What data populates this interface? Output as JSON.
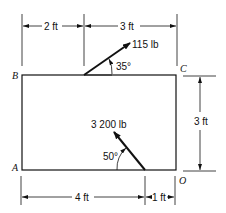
{
  "diagram": {
    "points": {
      "A": "A",
      "B": "B",
      "C": "C",
      "O": "O"
    },
    "dimensions": {
      "top_left": "2 ft",
      "top_right": "3 ft",
      "right_height": "3 ft",
      "bottom_left": "4 ft",
      "bottom_right": "1 ft"
    },
    "forces": [
      {
        "magnitude": "115 lb",
        "angle": "35°",
        "location": "top edge, 2 ft from B"
      },
      {
        "magnitude": "3 200 lb",
        "angle": "50°",
        "location": "bottom edge, 4 ft from A"
      }
    ]
  }
}
